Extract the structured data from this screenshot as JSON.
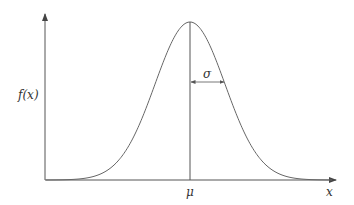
{
  "diagram": {
    "y_axis_label": "f(x)",
    "x_axis_label": "x",
    "mean_label": "μ",
    "sigma_label": "σ",
    "colors": {
      "line": "#555555",
      "background": "#ffffff"
    }
  },
  "chart_data": {
    "type": "line",
    "title": "",
    "xlabel": "x",
    "ylabel": "f(x)",
    "annotations": [
      "μ (mean, vertical line at peak)",
      "σ (standard deviation, horizontal double arrow from mean to inflection point)"
    ],
    "grid": false,
    "curve": "gaussian"
  }
}
